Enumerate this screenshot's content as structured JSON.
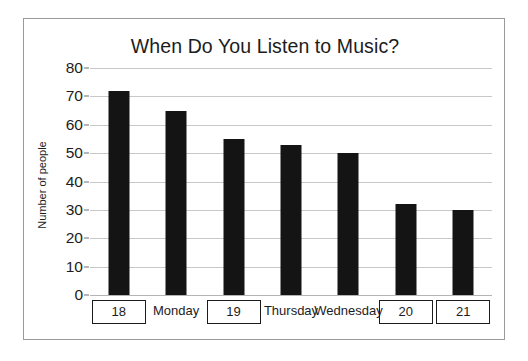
{
  "chart_data": {
    "type": "bar",
    "title": "When Do You Listen to Music?",
    "xlabel": "",
    "ylabel": "Number of people",
    "categories": [
      "18",
      "Monday",
      "19",
      "Thursday",
      "Wednesday",
      "20",
      "21"
    ],
    "values": [
      72,
      65,
      55,
      53,
      50,
      32,
      30
    ],
    "ylim": [
      0,
      80
    ],
    "ytick_labels": [
      "80",
      "70",
      "60",
      "50",
      "40",
      "30",
      "20",
      "10",
      "0"
    ],
    "ytick_values": [
      80,
      70,
      60,
      50,
      40,
      30,
      20,
      10,
      0
    ],
    "grid": true,
    "legend": false,
    "bar_color": "#141414",
    "grid_color": "#c8c8c8",
    "frame_color": "#9a9a9a",
    "category_styles": [
      "boxed",
      "plain",
      "boxed",
      "plain",
      "plain",
      "boxed",
      "boxed"
    ]
  }
}
